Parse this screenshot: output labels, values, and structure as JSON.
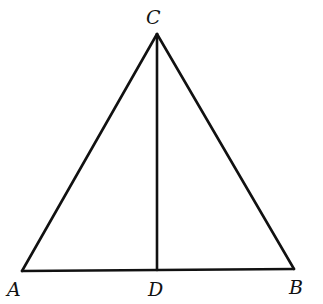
{
  "diagram": {
    "type": "geometry",
    "points": {
      "A": {
        "label": "A",
        "x": 22,
        "y": 271
      },
      "B": {
        "label": "B",
        "x": 294,
        "y": 269
      },
      "C": {
        "label": "C",
        "x": 157,
        "y": 34
      },
      "D": {
        "label": "D",
        "x": 157,
        "y": 270
      }
    },
    "segments": [
      [
        "A",
        "C"
      ],
      [
        "C",
        "B"
      ],
      [
        "A",
        "B"
      ],
      [
        "C",
        "D"
      ]
    ],
    "stroke_color": "#111111"
  }
}
